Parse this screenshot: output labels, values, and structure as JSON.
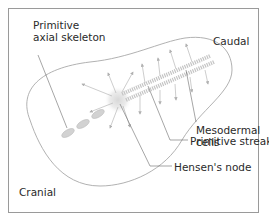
{
  "diagram": {
    "labels": {
      "primitive_axial_skeleton_1": "Primitive",
      "primitive_axial_skeleton_2": "axial skeleton",
      "caudal": "Caudal",
      "mesodermal_cells_1": "Mesodermal",
      "mesodermal_cells_2": "cells",
      "primitive_streak": "Primitive streak",
      "hensens_node": "Hensen's node",
      "cranial": "Cranial"
    },
    "colors": {
      "outline": "#a8a8a8",
      "streak": "#c8c8c8",
      "arrows": "#b8b8b8",
      "leader": "#6a6a6a",
      "text": "#2a2a2a"
    }
  }
}
